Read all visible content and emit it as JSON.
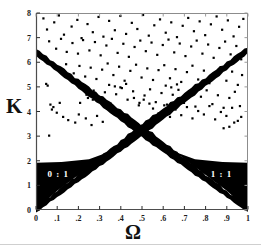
{
  "figure": {
    "title": "",
    "background": "#ffffff",
    "ink_color": "#000000"
  },
  "axes": {
    "x_label": "Ω",
    "y_label": "K",
    "x_ticks": [
      "0",
      ".1",
      ".2",
      ".3",
      ".4",
      ".5",
      ".6",
      ".7",
      ".8",
      ".9",
      "1"
    ],
    "y_ticks": [
      "0",
      "1",
      "2",
      "3",
      "4",
      "5",
      "6",
      "7",
      "8"
    ]
  },
  "annotations": {
    "left_region_label": "0 : 1",
    "right_region_label": "1 : 1"
  },
  "chart_data": {
    "type": "scatter",
    "title": "",
    "xlabel": "Ω",
    "ylabel": "K",
    "xlim": [
      0,
      1
    ],
    "ylim": [
      0,
      8
    ],
    "xticks": [
      0,
      0.1,
      0.2,
      0.3,
      0.4,
      0.5,
      0.6,
      0.7,
      0.8,
      0.9,
      1
    ],
    "xticklabels": [
      "0",
      ".1",
      ".2",
      ".3",
      ".4",
      ".5",
      ".6",
      ".7",
      ".8",
      ".9",
      "1"
    ],
    "yticks": [
      0,
      1,
      2,
      3,
      4,
      5,
      6,
      7,
      8
    ],
    "yticklabels": [
      "0",
      "1",
      "2",
      "3",
      "4",
      "5",
      "6",
      "7",
      "8"
    ],
    "grid": false,
    "legend": "none",
    "series": [
      {
        "name": "0:1 resonance tongue (filled wedge, lower left)",
        "kind": "polygon",
        "fill": "#000000",
        "label": "0 : 1",
        "label_xy": [
          0.105,
          1.35
        ],
        "vertices": [
          [
            0.0,
            0.0
          ],
          [
            0.0,
            1.92
          ],
          [
            0.12,
            1.95
          ],
          [
            0.25,
            2.06
          ],
          [
            0.34,
            2.35
          ],
          [
            0.42,
            2.75
          ],
          [
            0.47,
            3.12
          ],
          [
            0.5,
            3.5
          ],
          [
            0.5,
            3.35
          ],
          [
            0.42,
            2.82
          ],
          [
            0.33,
            2.26
          ],
          [
            0.22,
            1.55
          ],
          [
            0.1,
            0.78
          ]
        ]
      },
      {
        "name": "1:1 resonance tongue (filled wedge, lower right)",
        "kind": "polygon",
        "fill": "#000000",
        "label": "1 : 1",
        "label_xy": [
          0.875,
          1.35
        ],
        "vertices": [
          [
            1.0,
            0.0
          ],
          [
            1.0,
            1.92
          ],
          [
            0.88,
            1.95
          ],
          [
            0.75,
            2.06
          ],
          [
            0.66,
            2.35
          ],
          [
            0.58,
            2.75
          ],
          [
            0.53,
            3.12
          ],
          [
            0.5,
            3.5
          ],
          [
            0.5,
            3.35
          ],
          [
            0.58,
            2.82
          ],
          [
            0.67,
            2.26
          ],
          [
            0.78,
            1.55
          ],
          [
            0.9,
            0.78
          ]
        ]
      },
      {
        "name": "descending resonance band",
        "kind": "band",
        "fill": "#000000",
        "x_start": 0.0,
        "y_start": 6.4,
        "x_end": 1.0,
        "y_end": 0.0,
        "thickness_start": 0.28,
        "thickness_mid": 0.5,
        "thickness_end": 0.2
      },
      {
        "name": "ascending resonance band",
        "kind": "band",
        "fill": "#000000",
        "x_start": 0.0,
        "y_start": 0.0,
        "x_end": 1.0,
        "y_end": 6.5,
        "thickness_start": 0.2,
        "thickness_mid": 0.5,
        "thickness_end": 0.28
      },
      {
        "name": "chaotic / quasiperiodic orbits",
        "kind": "scatter",
        "marker": "square",
        "color": "#000000",
        "size": 2.2,
        "points": [
          [
            0.035,
            7.78
          ],
          [
            0.052,
            7.33
          ],
          [
            0.086,
            7.62
          ],
          [
            0.108,
            7.9
          ],
          [
            0.132,
            7.12
          ],
          [
            0.168,
            7.45
          ],
          [
            0.195,
            7.72
          ],
          [
            0.215,
            6.98
          ],
          [
            0.243,
            7.55
          ],
          [
            0.268,
            7.22
          ],
          [
            0.295,
            7.84
          ],
          [
            0.318,
            7.04
          ],
          [
            0.345,
            7.68
          ],
          [
            0.372,
            7.3
          ],
          [
            0.398,
            7.88
          ],
          [
            0.425,
            7.15
          ],
          [
            0.452,
            7.6
          ],
          [
            0.478,
            7.35
          ],
          [
            0.505,
            7.92
          ],
          [
            0.532,
            7.08
          ],
          [
            0.558,
            7.5
          ],
          [
            0.585,
            7.74
          ],
          [
            0.612,
            7.2
          ],
          [
            0.638,
            7.62
          ],
          [
            0.665,
            7.02
          ],
          [
            0.692,
            7.48
          ],
          [
            0.718,
            7.8
          ],
          [
            0.745,
            7.26
          ],
          [
            0.772,
            7.66
          ],
          [
            0.798,
            7.1
          ],
          [
            0.825,
            7.54
          ],
          [
            0.852,
            7.86
          ],
          [
            0.878,
            7.32
          ],
          [
            0.905,
            7.7
          ],
          [
            0.932,
            7.05
          ],
          [
            0.958,
            7.44
          ],
          [
            0.978,
            7.76
          ],
          [
            0.062,
            6.85
          ],
          [
            0.095,
            6.55
          ],
          [
            0.118,
            6.95
          ],
          [
            0.145,
            6.42
          ],
          [
            0.172,
            6.78
          ],
          [
            0.198,
            6.35
          ],
          [
            0.222,
            6.9
          ],
          [
            0.252,
            6.48
          ],
          [
            0.278,
            6.82
          ],
          [
            0.305,
            6.28
          ],
          [
            0.332,
            6.68
          ],
          [
            0.358,
            6.95
          ],
          [
            0.385,
            6.38
          ],
          [
            0.412,
            6.75
          ],
          [
            0.438,
            6.22
          ],
          [
            0.465,
            6.62
          ],
          [
            0.492,
            6.88
          ],
          [
            0.518,
            6.45
          ],
          [
            0.545,
            6.8
          ],
          [
            0.572,
            6.3
          ],
          [
            0.598,
            6.7
          ],
          [
            0.625,
            6.92
          ],
          [
            0.652,
            6.4
          ],
          [
            0.678,
            6.76
          ],
          [
            0.705,
            6.25
          ],
          [
            0.732,
            6.64
          ],
          [
            0.758,
            6.88
          ],
          [
            0.785,
            6.35
          ],
          [
            0.812,
            6.72
          ],
          [
            0.838,
            6.18
          ],
          [
            0.865,
            6.58
          ],
          [
            0.892,
            6.84
          ],
          [
            0.918,
            6.32
          ],
          [
            0.945,
            6.66
          ],
          [
            0.968,
            6.12
          ],
          [
            0.142,
            5.92
          ],
          [
            0.178,
            5.55
          ],
          [
            0.205,
            5.85
          ],
          [
            0.232,
            5.42
          ],
          [
            0.258,
            5.78
          ],
          [
            0.285,
            5.32
          ],
          [
            0.312,
            5.7
          ],
          [
            0.338,
            5.95
          ],
          [
            0.365,
            5.48
          ],
          [
            0.392,
            5.82
          ],
          [
            0.418,
            5.25
          ],
          [
            0.445,
            5.65
          ],
          [
            0.472,
            5.9
          ],
          [
            0.498,
            5.38
          ],
          [
            0.525,
            5.75
          ],
          [
            0.552,
            5.28
          ],
          [
            0.578,
            5.68
          ],
          [
            0.605,
            5.88
          ],
          [
            0.632,
            5.35
          ],
          [
            0.658,
            5.72
          ],
          [
            0.685,
            5.2
          ],
          [
            0.712,
            5.6
          ],
          [
            0.738,
            5.86
          ],
          [
            0.765,
            5.3
          ],
          [
            0.792,
            5.66
          ],
          [
            0.818,
            5.15
          ],
          [
            0.845,
            5.55
          ],
          [
            0.872,
            5.8
          ],
          [
            0.898,
            5.25
          ],
          [
            0.925,
            5.62
          ],
          [
            0.952,
            5.08
          ],
          [
            0.972,
            5.48
          ],
          [
            0.218,
            4.92
          ],
          [
            0.245,
            4.55
          ],
          [
            0.272,
            4.85
          ],
          [
            0.298,
            4.42
          ],
          [
            0.325,
            4.78
          ],
          [
            0.352,
            4.32
          ],
          [
            0.378,
            4.7
          ],
          [
            0.405,
            4.95
          ],
          [
            0.432,
            4.48
          ],
          [
            0.458,
            4.82
          ],
          [
            0.485,
            4.25
          ],
          [
            0.512,
            4.65
          ],
          [
            0.538,
            4.9
          ],
          [
            0.565,
            4.38
          ],
          [
            0.592,
            4.75
          ],
          [
            0.618,
            4.28
          ],
          [
            0.645,
            4.68
          ],
          [
            0.672,
            4.88
          ],
          [
            0.698,
            4.35
          ],
          [
            0.725,
            4.72
          ],
          [
            0.752,
            4.2
          ],
          [
            0.778,
            4.6
          ],
          [
            0.805,
            4.86
          ],
          [
            0.832,
            4.3
          ],
          [
            0.858,
            4.66
          ],
          [
            0.885,
            4.15
          ],
          [
            0.912,
            4.55
          ],
          [
            0.938,
            4.8
          ],
          [
            0.962,
            4.22
          ],
          [
            0.048,
            5.12
          ],
          [
            0.055,
            5.05
          ],
          [
            0.068,
            4.28
          ],
          [
            0.082,
            4.18
          ],
          [
            0.075,
            4.08
          ],
          [
            0.098,
            3.95
          ],
          [
            0.112,
            4.35
          ],
          [
            0.062,
            3.02
          ],
          [
            0.128,
            3.78
          ],
          [
            0.152,
            3.65
          ],
          [
            0.185,
            3.55
          ],
          [
            0.202,
            3.88
          ],
          [
            0.235,
            3.72
          ],
          [
            0.262,
            3.45
          ],
          [
            0.288,
            3.82
          ],
          [
            0.315,
            3.58
          ],
          [
            0.315,
            4.52
          ],
          [
            0.295,
            4.62
          ],
          [
            0.268,
            4.48
          ],
          [
            0.238,
            4.68
          ],
          [
            0.208,
            4.35
          ],
          [
            0.552,
            4.12
          ],
          [
            0.578,
            3.92
          ],
          [
            0.605,
            4.25
          ],
          [
            0.632,
            3.78
          ],
          [
            0.658,
            4.08
          ],
          [
            0.685,
            3.85
          ],
          [
            0.712,
            4.18
          ],
          [
            0.738,
            3.72
          ],
          [
            0.765,
            4.02
          ],
          [
            0.792,
            3.88
          ],
          [
            0.818,
            4.22
          ],
          [
            0.845,
            3.68
          ],
          [
            0.872,
            3.98
          ],
          [
            0.898,
            3.82
          ],
          [
            0.925,
            4.15
          ],
          [
            0.885,
            3.32
          ],
          [
            0.912,
            3.38
          ],
          [
            0.935,
            3.55
          ],
          [
            0.952,
            3.62
          ],
          [
            0.968,
            3.78
          ],
          [
            0.508,
            4.48
          ],
          [
            0.535,
            4.32
          ],
          [
            0.462,
            4.55
          ],
          [
            0.488,
            4.35
          ],
          [
            0.345,
            5.08
          ],
          [
            0.372,
            5.02
          ],
          [
            0.398,
            4.98
          ],
          [
            0.425,
            5.12
          ],
          [
            0.612,
            5.05
          ],
          [
            0.638,
            4.98
          ],
          [
            0.665,
            5.1
          ]
        ]
      }
    ]
  }
}
